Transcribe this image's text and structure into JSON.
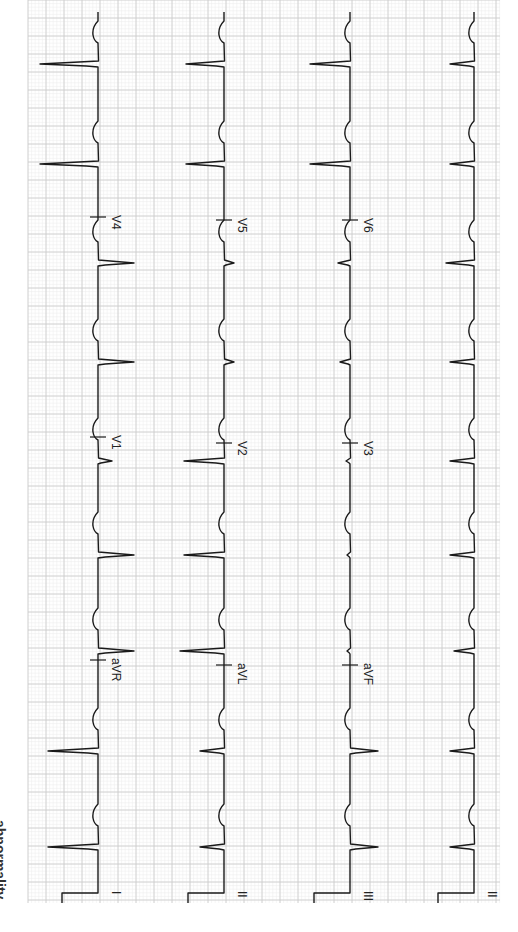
{
  "caption": "abnormality.",
  "chart_data": {
    "type": "line",
    "orientation": "rotated-90-clockwise",
    "grid": {
      "on": true,
      "x_start": 28,
      "x_end": 500,
      "y_start": 0,
      "y_end": 903,
      "major_px": 18,
      "minor_px": 3.6,
      "major_color": "#c9c9c9",
      "minor_color": "#ececec"
    },
    "trace_color": "#1a1a1a",
    "beat_positions_y": [
      65,
      165,
      264,
      363,
      462,
      556,
      652,
      752,
      848
    ],
    "rows": [
      {
        "baseline_x": 98,
        "leads": [
          {
            "name": "V4",
            "tick_y": 217
          },
          {
            "name": "V1",
            "tick_y": 437
          },
          {
            "name": "aVR",
            "tick_y": 660
          },
          {
            "name": "I",
            "tick_y": 893
          }
        ],
        "beats": [
          {
            "y": 65,
            "amp": -58
          },
          {
            "y": 165,
            "amp": -58
          },
          {
            "y": 264,
            "amp": 36
          },
          {
            "y": 363,
            "amp": 36
          },
          {
            "y": 462,
            "amp": 14
          },
          {
            "y": 556,
            "amp": 36
          },
          {
            "y": 652,
            "amp": 36
          },
          {
            "y": 752,
            "amp": -50
          },
          {
            "y": 848,
            "amp": -50
          }
        ]
      },
      {
        "baseline_x": 224,
        "leads": [
          {
            "name": "V5",
            "tick_y": 220
          },
          {
            "name": "V2",
            "tick_y": 443
          },
          {
            "name": "aVL",
            "tick_y": 665
          },
          {
            "name": "II",
            "tick_y": 893
          }
        ],
        "beats": [
          {
            "y": 65,
            "amp": -38
          },
          {
            "y": 165,
            "amp": -38
          },
          {
            "y": 264,
            "amp": 10
          },
          {
            "y": 363,
            "amp": 10
          },
          {
            "y": 462,
            "amp": -40
          },
          {
            "y": 556,
            "amp": -40
          },
          {
            "y": 652,
            "amp": -44
          },
          {
            "y": 752,
            "amp": -24
          },
          {
            "y": 848,
            "amp": -24
          }
        ]
      },
      {
        "baseline_x": 350,
        "leads": [
          {
            "name": "V6",
            "tick_y": 220
          },
          {
            "name": "V3",
            "tick_y": 443
          },
          {
            "name": "aVF",
            "tick_y": 665
          },
          {
            "name": "III",
            "tick_y": 893
          }
        ],
        "beats": [
          {
            "y": 65,
            "amp": -40
          },
          {
            "y": 165,
            "amp": -40
          },
          {
            "y": 264,
            "amp": -12
          },
          {
            "y": 363,
            "amp": -10
          },
          {
            "y": 462,
            "amp": -4
          },
          {
            "y": 556,
            "amp": -3
          },
          {
            "y": 652,
            "amp": -3
          },
          {
            "y": 752,
            "amp": 28
          },
          {
            "y": 848,
            "amp": 28
          }
        ]
      },
      {
        "baseline_x": 474,
        "leads": [
          {
            "name": "II",
            "tick_y": 893
          }
        ],
        "beats": [
          {
            "y": 65,
            "amp": -24
          },
          {
            "y": 165,
            "amp": -24
          },
          {
            "y": 264,
            "amp": -28
          },
          {
            "y": 363,
            "amp": -24
          },
          {
            "y": 462,
            "amp": -24
          },
          {
            "y": 556,
            "amp": -24
          },
          {
            "y": 652,
            "amp": -20
          },
          {
            "y": 752,
            "amp": -24
          },
          {
            "y": 848,
            "amp": -24
          }
        ]
      }
    ],
    "calibration": {
      "width_px": 36,
      "height_px": 10,
      "note": "1 mV calibration pulse at bottom of each row"
    }
  }
}
